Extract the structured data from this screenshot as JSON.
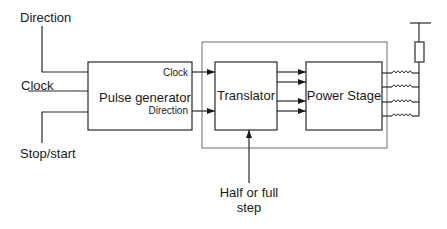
{
  "diagram": {
    "type": "block-diagram",
    "inputs": {
      "direction": "Direction",
      "clock": "Clock",
      "stop_start": "Stop/start",
      "step_mode": [
        "Half or full",
        "step"
      ]
    },
    "blocks": {
      "pulse_generator": {
        "label": "Pulse generator",
        "out_clock": "Clock",
        "out_direction": "Direction"
      },
      "translator": {
        "label": "Translator"
      },
      "power_stage": {
        "label": "Power Stage"
      }
    },
    "connections": [
      {
        "from": "Direction",
        "to": "Pulse generator"
      },
      {
        "from": "Clock",
        "to": "Pulse generator"
      },
      {
        "from": "Stop/start",
        "to": "Pulse generator"
      },
      {
        "from": "Pulse generator.Clock",
        "to": "Translator"
      },
      {
        "from": "Pulse generator.Direction",
        "to": "Translator"
      },
      {
        "from": "Half or full step",
        "to": "Translator"
      },
      {
        "from": "Translator",
        "to": "Power Stage",
        "count": 4
      },
      {
        "from": "Power Stage",
        "to": "Motor coils",
        "count": 4
      }
    ],
    "colors": {
      "line": "#2a2a2a",
      "outer_frame": "#6e6e6e",
      "background": "#ffffff"
    }
  }
}
